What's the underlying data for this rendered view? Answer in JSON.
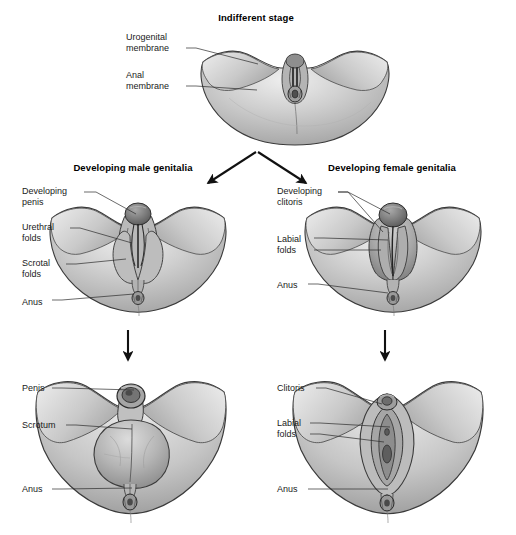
{
  "figure": {
    "type": "medical-illustration",
    "background_color": "#ffffff",
    "line_color": "#2b2b2b",
    "skin_tone": "#c3c3c3",
    "skin_shadow": "#9a9a9a",
    "skin_highlight": "#e6e6e6",
    "structure_dark": "#6d6d6d"
  },
  "panels": [
    {
      "id": "indifferent",
      "title": "Indifferent stage",
      "labels": [
        {
          "id": "urogenital-membrane",
          "lines": [
            "Urogenital",
            "membrane"
          ]
        },
        {
          "id": "anal-membrane",
          "lines": [
            "Anal",
            "membrane"
          ]
        }
      ]
    },
    {
      "id": "developing-male",
      "title": "Developing male genitalia",
      "labels": [
        {
          "id": "developing-penis",
          "lines": [
            "Developing",
            "penis"
          ]
        },
        {
          "id": "urethral-folds",
          "lines": [
            "Urethral",
            "folds"
          ]
        },
        {
          "id": "scrotal-folds",
          "lines": [
            "Scrotal",
            "folds"
          ]
        },
        {
          "id": "anus",
          "lines": [
            "Anus"
          ]
        }
      ]
    },
    {
      "id": "developing-female",
      "title": "Developing female genitalia",
      "labels": [
        {
          "id": "developing-clitoris",
          "lines": [
            "Developing",
            "clitoris"
          ]
        },
        {
          "id": "labial-folds",
          "lines": [
            "Labial",
            "folds"
          ]
        },
        {
          "id": "anus",
          "lines": [
            "Anus"
          ]
        }
      ]
    },
    {
      "id": "mature-male",
      "title": "",
      "labels": [
        {
          "id": "penis",
          "lines": [
            "Penis"
          ]
        },
        {
          "id": "scrotum",
          "lines": [
            "Scrotum"
          ]
        },
        {
          "id": "anus",
          "lines": [
            "Anus"
          ]
        }
      ]
    },
    {
      "id": "mature-female",
      "title": "",
      "labels": [
        {
          "id": "clitoris",
          "lines": [
            "Clitoris"
          ]
        },
        {
          "id": "labial-folds",
          "lines": [
            "Labial",
            "folds"
          ]
        },
        {
          "id": "anus",
          "lines": [
            "Anus"
          ]
        }
      ]
    }
  ],
  "text": {
    "indifferent_stage": "Indifferent stage",
    "developing_male_genitalia": "Developing male genitalia",
    "developing_female_genitalia": "Developing female genitalia",
    "urogenital_1": "Urogenital",
    "urogenital_2": "membrane",
    "anal_1": "Anal",
    "anal_2": "membrane",
    "dev_penis_1": "Developing",
    "dev_penis_2": "penis",
    "urethral_1": "Urethral",
    "urethral_2": "folds",
    "scrotal_1": "Scrotal",
    "scrotal_2": "folds",
    "anus_male_mid": "Anus",
    "dev_clitoris_1": "Developing",
    "dev_clitoris_2": "clitoris",
    "labial_mid_1": "Labial",
    "labial_mid_2": "folds",
    "anus_female_mid": "Anus",
    "penis": "Penis",
    "scrotum": "Scrotum",
    "anus_male_bottom": "Anus",
    "clitoris": "Clitoris",
    "labial_bot_1": "Labial",
    "labial_bot_2": "folds",
    "anus_female_bottom": "Anus"
  },
  "arrows": {
    "branch_label": "branching arrows from indifferent stage to male and female",
    "male_progress_label": "downward arrow to mature male",
    "female_progress_label": "downward arrow to mature female"
  }
}
